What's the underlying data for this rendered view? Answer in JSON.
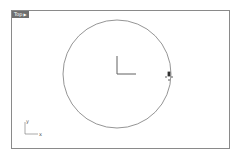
{
  "viewport": {
    "label": "Top",
    "dropdown_glyph": "▶",
    "border_color": "#8a8a8a",
    "label_bg": "#6e6e6e"
  },
  "scene": {
    "circle": {
      "cx": 117,
      "cy": 74,
      "r": 54,
      "stroke": "#7a7a7a"
    },
    "origin_axes": {
      "x": 117,
      "y": 74,
      "len_x": 19,
      "len_y": 18,
      "color": "#606060"
    },
    "cursor": {
      "x": 169,
      "y": 77,
      "color": "#333333"
    }
  },
  "axis_icon": {
    "x_label": "x",
    "y_label": "y"
  }
}
